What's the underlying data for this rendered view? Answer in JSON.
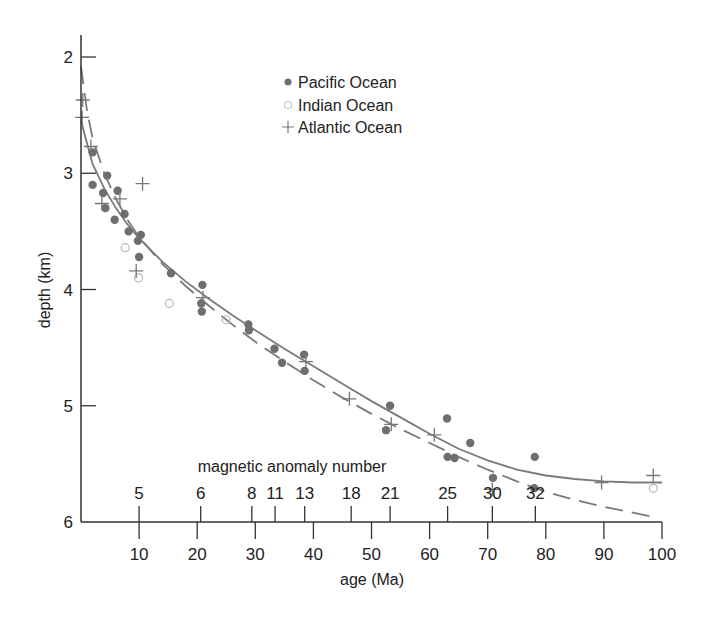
{
  "chart_data": {
    "type": "scatter",
    "title": "",
    "xlabel": "age (Ma)",
    "ylabel": "depth (km)",
    "xlim": [
      0,
      100
    ],
    "ylim": [
      6,
      2
    ],
    "y_inverted": true,
    "grid": false,
    "legend_position": "upper center",
    "x_ticks": [
      10,
      20,
      30,
      40,
      50,
      60,
      70,
      80,
      90,
      100
    ],
    "y_ticks": [
      2,
      3,
      4,
      5,
      6
    ],
    "secondary_axis": {
      "label": "magnetic anomaly number",
      "ticks": [
        {
          "label": "5",
          "age": 10
        },
        {
          "label": "6",
          "age": 20.6
        },
        {
          "label": "8",
          "age": 29.4
        },
        {
          "label": "11",
          "age": 33.4
        },
        {
          "label": "13",
          "age": 38.5
        },
        {
          "label": "18",
          "age": 46.5
        },
        {
          "label": "21",
          "age": 53.2
        },
        {
          "label": "25",
          "age": 63.1
        },
        {
          "label": "30",
          "age": 70.8
        },
        {
          "label": "32",
          "age": 78.2
        }
      ]
    },
    "series": [
      {
        "name": "Pacific Ocean",
        "marker": "filled-circle",
        "color": "#6e6e6e",
        "points": [
          [
            2.0,
            2.82
          ],
          [
            2.0,
            3.1
          ],
          [
            3.8,
            3.17
          ],
          [
            4.2,
            3.3
          ],
          [
            4.5,
            3.02
          ],
          [
            5.8,
            3.4
          ],
          [
            6.3,
            3.15
          ],
          [
            7.5,
            3.35
          ],
          [
            8.2,
            3.5
          ],
          [
            9.8,
            3.58
          ],
          [
            10.3,
            3.53
          ],
          [
            10.0,
            3.72
          ],
          [
            15.5,
            3.86
          ],
          [
            20.9,
            3.96
          ],
          [
            20.7,
            4.12
          ],
          [
            20.8,
            4.19
          ],
          [
            28.8,
            4.3
          ],
          [
            28.9,
            4.35
          ],
          [
            33.3,
            4.51
          ],
          [
            34.6,
            4.63
          ],
          [
            38.4,
            4.56
          ],
          [
            38.5,
            4.7
          ],
          [
            53.2,
            5.0
          ],
          [
            52.5,
            5.21
          ],
          [
            63.0,
            5.11
          ],
          [
            63.1,
            5.44
          ],
          [
            64.3,
            5.45
          ],
          [
            67.0,
            5.32
          ],
          [
            70.9,
            5.62
          ],
          [
            78.1,
            5.44
          ],
          [
            78.0,
            5.71
          ]
        ]
      },
      {
        "name": "Indian Ocean",
        "marker": "open-circle",
        "color": "#b8b8b8",
        "points": [
          [
            7.6,
            3.64
          ],
          [
            9.9,
            3.9
          ],
          [
            15.2,
            4.12
          ],
          [
            25.0,
            4.26
          ],
          [
            98.5,
            5.71
          ]
        ]
      },
      {
        "name": "Atlantic Ocean",
        "marker": "plus",
        "color": "#777777",
        "points": [
          [
            0.3,
            2.37
          ],
          [
            0.2,
            2.52
          ],
          [
            1.7,
            2.77
          ],
          [
            3.6,
            3.26
          ],
          [
            6.7,
            3.22
          ],
          [
            10.6,
            3.09
          ],
          [
            9.5,
            3.84
          ],
          [
            21.0,
            4.07
          ],
          [
            38.7,
            4.62
          ],
          [
            46.2,
            4.94
          ],
          [
            53.4,
            5.16
          ],
          [
            60.8,
            5.25
          ],
          [
            70.8,
            5.72
          ],
          [
            89.6,
            5.66
          ],
          [
            98.5,
            5.6
          ]
        ]
      }
    ],
    "curves": [
      {
        "name": "solid-fit",
        "style": "solid",
        "points": [
          [
            0,
            2.55
          ],
          [
            2,
            2.92
          ],
          [
            4,
            3.13
          ],
          [
            6,
            3.3
          ],
          [
            8,
            3.44
          ],
          [
            10,
            3.56
          ],
          [
            14,
            3.76
          ],
          [
            18,
            3.93
          ],
          [
            22,
            4.08
          ],
          [
            26,
            4.22
          ],
          [
            30,
            4.35
          ],
          [
            35,
            4.51
          ],
          [
            40,
            4.66
          ],
          [
            45,
            4.81
          ],
          [
            50,
            4.96
          ],
          [
            55,
            5.1
          ],
          [
            60,
            5.24
          ],
          [
            65,
            5.37
          ],
          [
            70,
            5.47
          ],
          [
            75,
            5.55
          ],
          [
            80,
            5.6
          ],
          [
            85,
            5.63
          ],
          [
            90,
            5.65
          ],
          [
            95,
            5.66
          ],
          [
            100,
            5.66
          ]
        ]
      },
      {
        "name": "dashed-fit",
        "style": "dashed",
        "points": [
          [
            0,
            2.08
          ],
          [
            1,
            2.45
          ],
          [
            2,
            2.7
          ],
          [
            4,
            3.0
          ],
          [
            6,
            3.22
          ],
          [
            8,
            3.4
          ],
          [
            10,
            3.55
          ],
          [
            14,
            3.78
          ],
          [
            18,
            3.97
          ],
          [
            22,
            4.14
          ],
          [
            26,
            4.3
          ],
          [
            30,
            4.45
          ],
          [
            35,
            4.62
          ],
          [
            40,
            4.78
          ],
          [
            45,
            4.93
          ],
          [
            50,
            5.07
          ],
          [
            55,
            5.2
          ],
          [
            60,
            5.32
          ],
          [
            65,
            5.44
          ],
          [
            70,
            5.55
          ],
          [
            75,
            5.65
          ],
          [
            80,
            5.74
          ],
          [
            85,
            5.81
          ],
          [
            90,
            5.87
          ],
          [
            95,
            5.92
          ],
          [
            99,
            5.96
          ]
        ]
      }
    ]
  },
  "legend": {
    "items": [
      {
        "label": "Pacific Ocean",
        "marker": "filled-circle"
      },
      {
        "label": "Indian Ocean",
        "marker": "open-circle"
      },
      {
        "label": "Atlantic Ocean",
        "marker": "plus"
      }
    ]
  },
  "axes": {
    "xlabel": "age (Ma)",
    "ylabel": "depth (km)",
    "anomaly_label": "magnetic anomaly number"
  }
}
